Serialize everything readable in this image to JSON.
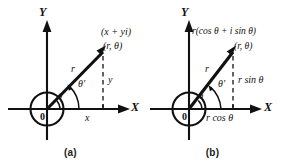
{
  "figure": {
    "background_color": "#ffffff",
    "line_color": "#111111",
    "panels": [
      {
        "id": "a",
        "caption": "(a)",
        "axis_y_label": "Y",
        "axis_x_label": "X",
        "origin_label": "0",
        "radius_label": "r",
        "angle_inner_label": "θ",
        "angle_outer_label": "θ′",
        "point_label_line1": "(x + yi)",
        "point_label_line2": "(r, θ)",
        "horizontal_leg_label": "x",
        "vertical_leg_label": "y"
      },
      {
        "id": "b",
        "caption": "(b)",
        "axis_y_label": "Y",
        "axis_x_label": "X",
        "origin_label": "0",
        "radius_label": "r",
        "angle_inner_label": "θ",
        "angle_outer_label": "θ′",
        "point_label_line1": "r(cos θ + i sin θ)",
        "point_label_line2": "(r, θ)",
        "horizontal_leg_label": "r cos θ",
        "vertical_leg_label": "r sin θ"
      }
    ]
  }
}
